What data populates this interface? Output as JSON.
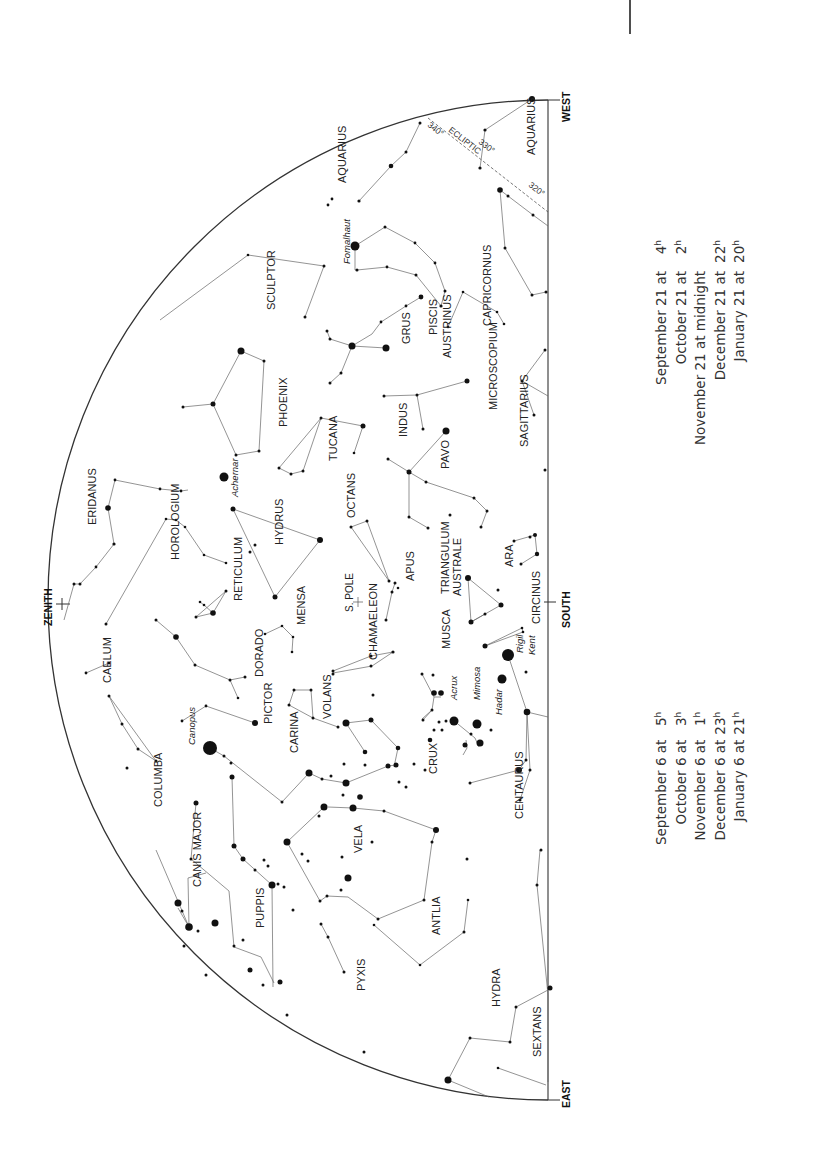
{
  "page_marker": {
    "x": 630,
    "y1": 0,
    "y2": 34
  },
  "chart": {
    "type": "sky-map",
    "orientation": "rotated -90deg (horizon vertical on right)",
    "horizon": {
      "x": 548,
      "top_y": 100,
      "bottom_y": 1100
    },
    "dome": {
      "cx": 548,
      "cy": 600,
      "r": 488
    },
    "directions": [
      {
        "id": "west",
        "label": "WEST",
        "x": 570,
        "y": 122
      },
      {
        "id": "south",
        "label": "SOUTH",
        "x": 570,
        "y": 628
      },
      {
        "id": "east",
        "label": "EAST",
        "x": 570,
        "y": 1108
      },
      {
        "id": "zenith",
        "label": "ZENITH",
        "x": 52,
        "y": 626
      }
    ],
    "ecliptic": {
      "label": "ECLIPTIC",
      "marks": [
        "340°",
        "330°",
        "320°"
      ]
    },
    "special_marks": [
      {
        "id": "south-pole",
        "label": "S. POLE",
        "x": 358,
        "y": 602
      }
    ],
    "constellations": [
      {
        "name": "AQUARIUS",
        "x": 346,
        "y": 183
      },
      {
        "name": "AQUARIUS",
        "x": 535,
        "y": 155
      },
      {
        "name": "PISCIS",
        "x": 437,
        "y": 335
      },
      {
        "name": "AUSTRINUS",
        "x": 451,
        "y": 358
      },
      {
        "name": "CAPRICORNUS",
        "x": 491,
        "y": 326
      },
      {
        "name": "SCULPTOR",
        "x": 275,
        "y": 310
      },
      {
        "name": "GRUS",
        "x": 410,
        "y": 344
      },
      {
        "name": "MICROSCOPIUM",
        "x": 497,
        "y": 410
      },
      {
        "name": "PHOENIX",
        "x": 287,
        "y": 427
      },
      {
        "name": "INDUS",
        "x": 407,
        "y": 437
      },
      {
        "name": "SAGITTARIUS",
        "x": 528,
        "y": 447
      },
      {
        "name": "TUCANA",
        "x": 337,
        "y": 461
      },
      {
        "name": "PAVO",
        "x": 449,
        "y": 469
      },
      {
        "name": "OCTANS",
        "x": 355,
        "y": 518
      },
      {
        "name": "ERIDANUS",
        "x": 96,
        "y": 525
      },
      {
        "name": "HOROLOGIUM",
        "x": 179,
        "y": 560
      },
      {
        "name": "HYDRUS",
        "x": 283,
        "y": 545
      },
      {
        "name": "ARA",
        "x": 513,
        "y": 567
      },
      {
        "name": "APUS",
        "x": 414,
        "y": 581
      },
      {
        "name": "TRIANGULUM",
        "x": 449,
        "y": 594
      },
      {
        "name": "AUSTRALE",
        "x": 461,
        "y": 596
      },
      {
        "name": "RETICULUM",
        "x": 242,
        "y": 601
      },
      {
        "name": "S. POLE",
        "x": 353,
        "y": 609
      },
      {
        "name": "CIRCINUS",
        "x": 540,
        "y": 624
      },
      {
        "name": "MENSA",
        "x": 305,
        "y": 625
      },
      {
        "name": "CAELUM",
        "x": 111,
        "y": 683
      },
      {
        "name": "DORADO",
        "x": 263,
        "y": 677
      },
      {
        "name": "CHAMAELEON",
        "x": 377,
        "y": 660
      },
      {
        "name": "MUSCA",
        "x": 450,
        "y": 649
      },
      {
        "name": "VOLANS",
        "x": 331,
        "y": 719
      },
      {
        "name": "PICTOR",
        "x": 272,
        "y": 724
      },
      {
        "name": "CARINA",
        "x": 298,
        "y": 753
      },
      {
        "name": "CRUX",
        "x": 437,
        "y": 774
      },
      {
        "name": "COLUMBA",
        "x": 162,
        "y": 807
      },
      {
        "name": "CENTAURUS",
        "x": 523,
        "y": 819
      },
      {
        "name": "VELA",
        "x": 362,
        "y": 853
      },
      {
        "name": "CANIS MAJOR",
        "x": 201,
        "y": 887
      },
      {
        "name": "PUPPIS",
        "x": 264,
        "y": 928
      },
      {
        "name": "ANTLIA",
        "x": 440,
        "y": 935
      },
      {
        "name": "PYXIS",
        "x": 365,
        "y": 991
      },
      {
        "name": "HYDRA",
        "x": 500,
        "y": 1007
      },
      {
        "name": "SEXTANS",
        "x": 541,
        "y": 1057
      }
    ],
    "named_stars": [
      {
        "name": "Fomalhaut",
        "x": 350,
        "y": 264
      },
      {
        "name": "Achernar",
        "x": 238,
        "y": 497
      },
      {
        "name": "Acrux",
        "x": 457,
        "y": 700
      },
      {
        "name": "Mimosa",
        "x": 480,
        "y": 700
      },
      {
        "name": "Rigil",
        "x": 523,
        "y": 653
      },
      {
        "name": "Kent",
        "x": 535,
        "y": 655
      },
      {
        "name": "Hadar",
        "x": 502,
        "y": 715
      },
      {
        "name": "Canopus",
        "x": 195,
        "y": 745
      }
    ]
  },
  "times_table_21": {
    "rows": [
      {
        "date": "September 21 at",
        "hour": "4",
        "unit": "h"
      },
      {
        "date": "October 21 at",
        "hour": "2",
        "unit": "h"
      },
      {
        "date": "November 21 at midnight",
        "hour": "",
        "unit": ""
      },
      {
        "date": "December 21 at",
        "hour": "22",
        "unit": "h"
      },
      {
        "date": "January 21 at",
        "hour": "20",
        "unit": "h"
      }
    ]
  },
  "times_table_6": {
    "rows": [
      {
        "date": "September 6 at",
        "hour": "5",
        "unit": "h"
      },
      {
        "date": "October 6 at",
        "hour": "3",
        "unit": "h"
      },
      {
        "date": "November 6 at",
        "hour": "1",
        "unit": "h"
      },
      {
        "date": "December 6 at",
        "hour": "23",
        "unit": "h"
      },
      {
        "date": "January 6 at",
        "hour": "21",
        "unit": "h"
      }
    ]
  }
}
